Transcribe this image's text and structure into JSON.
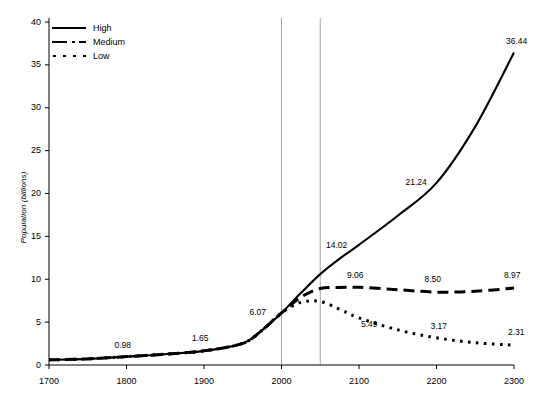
{
  "chart_data": {
    "type": "line",
    "title": "",
    "xlabel": "",
    "ylabel": "Population (billions)",
    "xlim": [
      1700,
      2300
    ],
    "ylim": [
      0,
      40
    ],
    "xticks": [
      "1700",
      "1800",
      "1900",
      "2000",
      "2100",
      "2200",
      "2300"
    ],
    "yticks": [
      "0",
      "5",
      "10",
      "15",
      "20",
      "25",
      "30",
      "35",
      "40"
    ],
    "grid": false,
    "legend_position": "top-left",
    "reference_lines": [
      {
        "name": "year-2000-line",
        "x": 2000,
        "color": "#a6a6a6"
      },
      {
        "name": "year-2050-line",
        "x": 2050,
        "color": "#a6a6a6"
      }
    ],
    "x": [
      1700,
      1750,
      1800,
      1850,
      1900,
      1950,
      1975,
      2000,
      2025,
      2050,
      2075,
      2100,
      2150,
      2200,
      2250,
      2300
    ],
    "series": [
      {
        "name": "High",
        "style": "solid",
        "color": "#000000",
        "values": [
          0.6,
          0.71,
          0.98,
          1.26,
          1.65,
          2.52,
          4.07,
          6.07,
          8.4,
          10.6,
          12.4,
          14.02,
          17.4,
          21.24,
          27.8,
          36.44
        ]
      },
      {
        "name": "Medium",
        "style": "dashed",
        "color": "#000000",
        "values": [
          0.6,
          0.71,
          0.98,
          1.26,
          1.65,
          2.52,
          4.07,
          6.07,
          7.9,
          8.92,
          9.05,
          9.06,
          8.78,
          8.5,
          8.6,
          8.97
        ]
      },
      {
        "name": "Low",
        "style": "dotted",
        "color": "#000000",
        "values": [
          0.6,
          0.71,
          0.98,
          1.26,
          1.65,
          2.52,
          4.07,
          6.07,
          7.3,
          7.4,
          6.5,
          5.49,
          4.1,
          3.17,
          2.6,
          2.31
        ]
      }
    ],
    "annotations": [
      {
        "name": "label-0-98",
        "text": "0.98",
        "x": 1800,
        "y": 0.98
      },
      {
        "name": "label-1-65",
        "text": "1.65",
        "x": 1900,
        "y": 1.65
      },
      {
        "name": "label-6-07",
        "text": "6.07",
        "x": 2000,
        "y": 6.07
      },
      {
        "name": "label-14-02",
        "text": "14.02",
        "x": 2100,
        "y": 14.02
      },
      {
        "name": "label-21-24",
        "text": "21.24",
        "x": 2200,
        "y": 21.24
      },
      {
        "name": "label-36-44",
        "text": "36.44",
        "x": 2300,
        "y": 36.44
      },
      {
        "name": "label-9-06",
        "text": "9.06",
        "x": 2100,
        "y": 9.06
      },
      {
        "name": "label-8-50",
        "text": "8.50",
        "x": 2200,
        "y": 8.5
      },
      {
        "name": "label-8-97",
        "text": "8.97",
        "x": 2300,
        "y": 8.97
      },
      {
        "name": "label-5-49",
        "text": "5.49",
        "x": 2100,
        "y": 5.49
      },
      {
        "name": "label-3-17",
        "text": "3.17",
        "x": 2200,
        "y": 3.17
      },
      {
        "name": "label-2-31",
        "text": "2.31",
        "x": 2300,
        "y": 2.31
      }
    ]
  },
  "legend": {
    "items": [
      {
        "label": "High",
        "style": "solid"
      },
      {
        "label": "Medium",
        "style": "dashed"
      },
      {
        "label": "Low",
        "style": "dotted"
      }
    ]
  },
  "axis": {
    "y_title": "Population (billions)"
  }
}
